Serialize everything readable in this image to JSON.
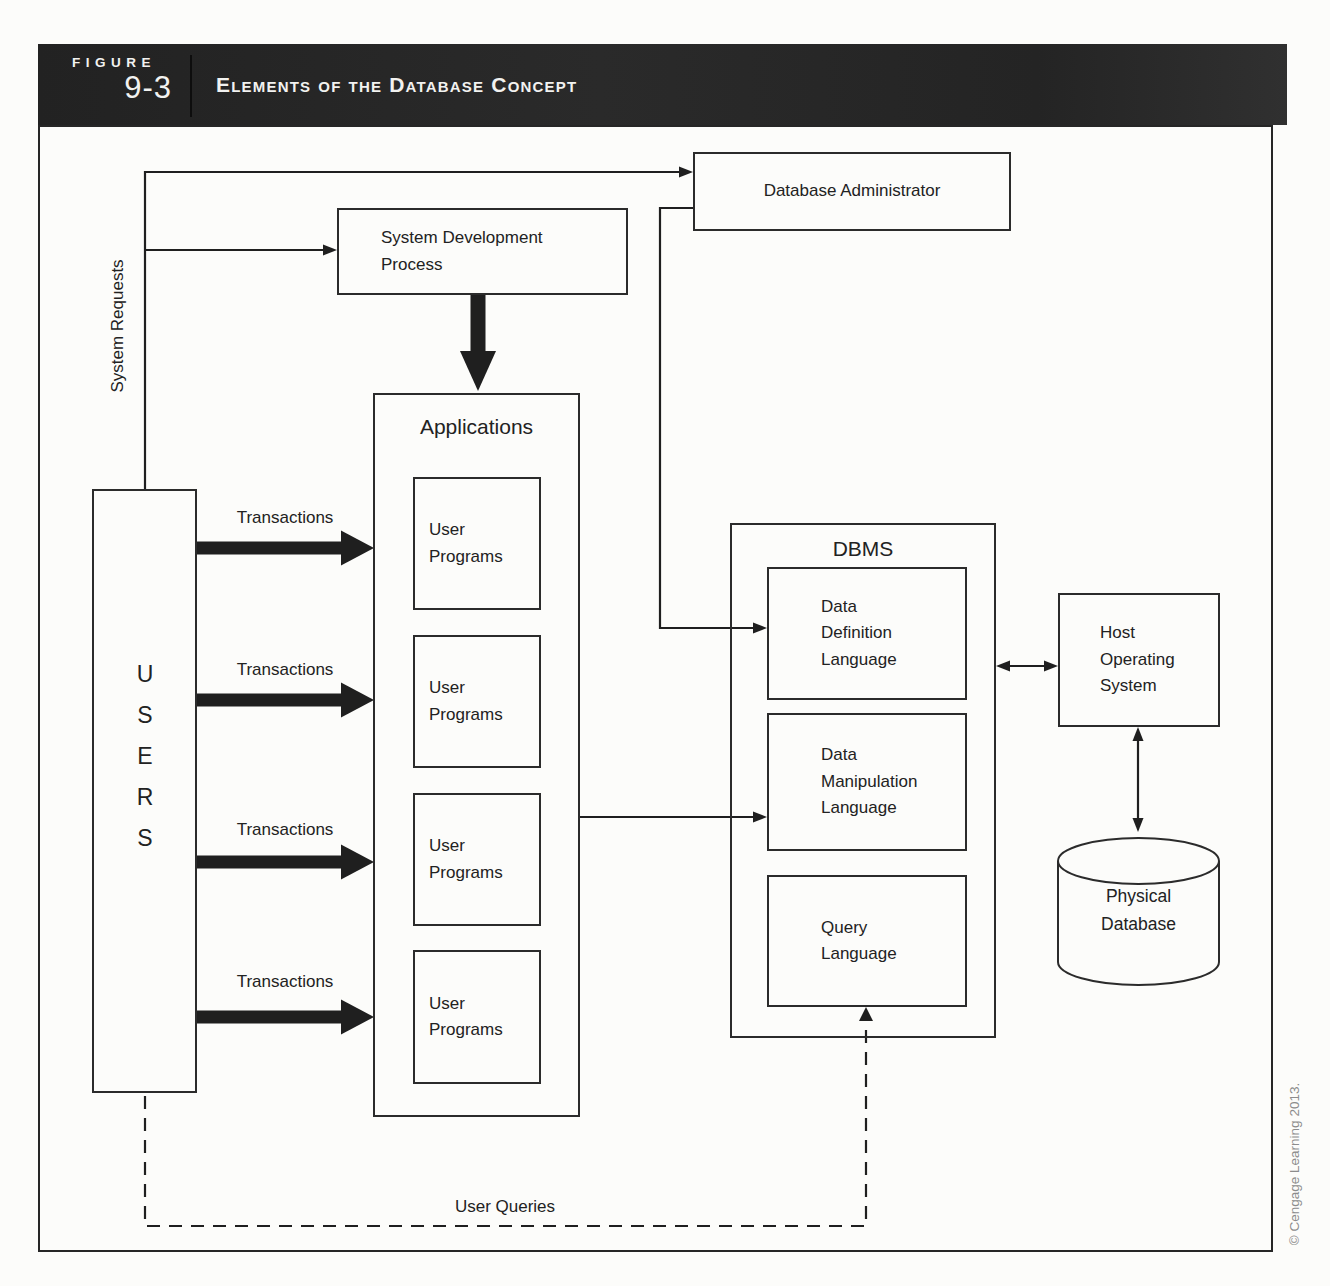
{
  "figure": {
    "eyebrow": "FIGURE",
    "number": "9-3",
    "title": "Elements of the Database Concept"
  },
  "nodes": {
    "database_administrator": "Database Administrator",
    "system_development_process": "System Development\nProcess",
    "applications": "Applications",
    "user_programs": "User\nPrograms",
    "users": "USERS",
    "dbms": "DBMS",
    "data_definition_language": "Data\nDefinition\nLanguage",
    "data_manipulation_language": "Data\nManipulation\nLanguage",
    "query_language": "Query\nLanguage",
    "host_operating_system": "Host\nOperating\nSystem",
    "physical_database": "Physical\nDatabase"
  },
  "edge_labels": {
    "system_requests": "System Requests",
    "transactions": "Transactions",
    "user_queries": "User Queries"
  },
  "copyright": "© Cengage Learning 2013.",
  "colors": {
    "header_bg": "#262626",
    "header_text": "#f2f2f0",
    "line": "#1f1f1f",
    "page_bg": "#fcfcfa",
    "copyright_text": "#8c8c8c"
  }
}
